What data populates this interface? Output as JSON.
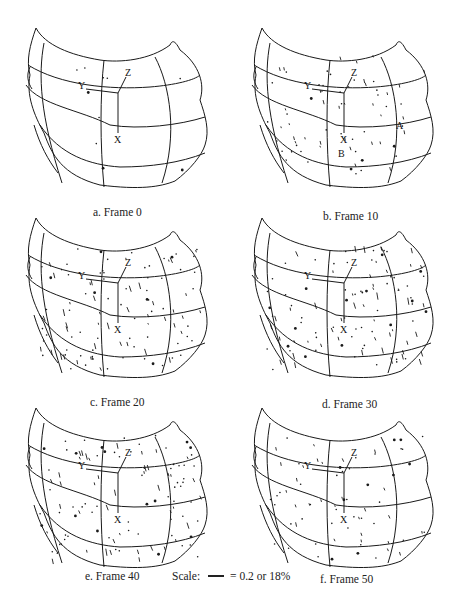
{
  "figure": {
    "panels": [
      {
        "id": "a",
        "caption": "a.  Frame 0",
        "label_a": "",
        "label_b": "",
        "density": 0
      },
      {
        "id": "b",
        "caption": "b.  Frame 10",
        "label_a": "A",
        "label_b": "B",
        "density": 1
      },
      {
        "id": "c",
        "caption": "c.  Frame 20",
        "label_a": "",
        "label_b": "",
        "density": 2
      },
      {
        "id": "d",
        "caption": "d.  Frame 30",
        "label_a": "",
        "label_b": "",
        "density": 2
      },
      {
        "id": "e",
        "caption": "e.  Frame 40",
        "label_a": "",
        "label_b": "",
        "density": 2
      },
      {
        "id": "f",
        "caption": "f.  Frame 50",
        "label_a": "",
        "label_b": "",
        "density": 1
      }
    ],
    "axes": {
      "x": "X",
      "y": "Y",
      "z": "Z"
    },
    "scale": {
      "label": "Scale:",
      "value": "= 0.2 or 18%"
    },
    "colors": {
      "ink": "#1a1a1a",
      "background": "#ffffff"
    }
  }
}
